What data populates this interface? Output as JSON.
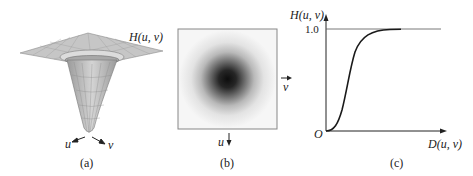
{
  "figure": {
    "panel_a": {
      "caption": "(a)",
      "surface_label": "H(u, v)",
      "axis_u": "u",
      "axis_v": "v"
    },
    "panel_b": {
      "caption": "(b)",
      "axis_v": "v",
      "axis_u": "u"
    },
    "panel_c": {
      "caption": "(c)",
      "y_label": "H(u, v)",
      "x_label": "D(u, v)",
      "y_tick": "1.0",
      "origin": "O"
    }
  },
  "colors": {
    "line": "#222222",
    "mesh": "#8a8a8a",
    "frame": "#888888"
  }
}
